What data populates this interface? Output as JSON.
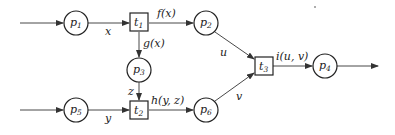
{
  "places": [
    {
      "id": "p1",
      "name": "p",
      "sub": "1",
      "cx": 76,
      "cy": 23
    },
    {
      "id": "p2",
      "name": "p",
      "sub": "2",
      "cx": 206,
      "cy": 23
    },
    {
      "id": "p3",
      "name": "p",
      "sub": "3",
      "cx": 139,
      "cy": 70
    },
    {
      "id": "p4",
      "name": "p",
      "sub": "4",
      "cx": 325,
      "cy": 66
    },
    {
      "id": "p5",
      "name": "p",
      "sub": "5",
      "cx": 76,
      "cy": 110
    },
    {
      "id": "p6",
      "name": "p",
      "sub": "6",
      "cx": 206,
      "cy": 110
    }
  ],
  "transitions": [
    {
      "id": "t1",
      "name": "t",
      "sub": "1",
      "cx": 139,
      "cy": 22
    },
    {
      "id": "t2",
      "name": "t",
      "sub": "2",
      "cx": 139,
      "cy": 110
    },
    {
      "id": "t3",
      "name": "t",
      "sub": "3",
      "cx": 264,
      "cy": 66
    }
  ],
  "edge_labels": {
    "x": "x",
    "f": "f(x)",
    "g": "g(x)",
    "z": "z",
    "y": "y",
    "h": "h(y, z)",
    "u": "u",
    "v": "v",
    "i": "i(u, v)"
  },
  "colors": {
    "stroke": "#222222",
    "background": "#ffffff"
  }
}
